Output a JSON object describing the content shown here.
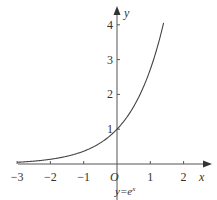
{
  "chart_data": {
    "type": "line",
    "title": "",
    "function": "y=e^x",
    "curve_label": "y=e",
    "curve_label_sup": "x",
    "xlabel": "x",
    "ylabel": "y",
    "origin_label": "O",
    "xlim": [
      -3,
      2.6
    ],
    "ylim": [
      0,
      4.5
    ],
    "x_ticks": [
      -3,
      -2,
      -1,
      1,
      2
    ],
    "x_tick_labels": [
      "−3",
      "−2",
      "−1",
      "1",
      "2"
    ],
    "y_ticks": [
      1,
      2,
      3,
      4
    ],
    "y_tick_labels": [
      "1",
      "2",
      "3",
      "4"
    ],
    "grid": false,
    "series": [
      {
        "name": "y=e^x",
        "x": [
          -3,
          -2.5,
          -2,
          -1.5,
          -1,
          -0.5,
          0,
          0.5,
          1,
          1.2,
          1.4
        ],
        "y": [
          0.05,
          0.08,
          0.14,
          0.22,
          0.37,
          0.61,
          1,
          1.65,
          2.72,
          3.32,
          4.06
        ]
      }
    ]
  }
}
